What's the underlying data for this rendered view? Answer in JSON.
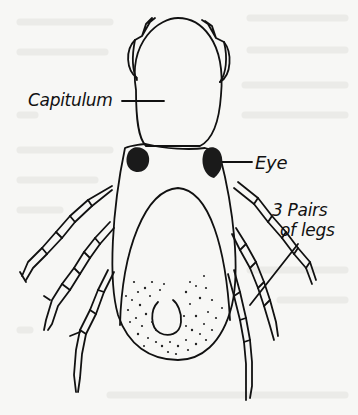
{
  "figure": {
    "colors": {
      "background": "#f7f7f5",
      "ink": "#111111",
      "eye_fill": "#1a1a1a",
      "bleed_through": "#e6e6e2"
    }
  },
  "labels": {
    "capitulum": "Capitulum",
    "eye": "Eye",
    "legs_line1": "3 Pairs",
    "legs_line2": "of legs"
  }
}
